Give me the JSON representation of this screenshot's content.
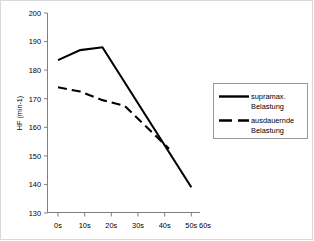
{
  "chart_data": {
    "type": "line",
    "title": "",
    "subtitle": "",
    "xlabel": "",
    "ylabel": "HF (min-1)",
    "categories": [
      "0s",
      "10s",
      "20s",
      "30s",
      "40s",
      "50s",
      "60s"
    ],
    "x": [
      0,
      10,
      20,
      30,
      40,
      50,
      60
    ],
    "xlim": [
      0,
      60
    ],
    "ylim": [
      130,
      200
    ],
    "yticks": [
      130,
      140,
      150,
      160,
      170,
      180,
      190,
      200
    ],
    "ytick_labels": [
      "130",
      "140",
      "150",
      "160",
      "170",
      "180",
      "190",
      "200"
    ],
    "grid": false,
    "legend_position": "right",
    "series": [
      {
        "name": "supramax. Belastung",
        "style": "solid",
        "color": "#000000",
        "x": [
          0,
          10,
          20,
          60
        ],
        "values": [
          183.5,
          187,
          188,
          139
        ],
        "x_labels": [
          "0s",
          "10s",
          "20s",
          "60s"
        ]
      },
      {
        "name": "ausdauernde Belastung",
        "style": "dashed",
        "color": "#000000",
        "x": [
          0,
          10,
          20,
          30,
          50
        ],
        "values": [
          174,
          172.5,
          169.5,
          167.5,
          152.5
        ],
        "x_labels": [
          "0s",
          "10s",
          "20s",
          "30s",
          "50s"
        ]
      }
    ]
  },
  "legend": {
    "entries": [
      {
        "label_line1": "supramax.",
        "label_line2": "Belastung",
        "style": "solid"
      },
      {
        "label_line1": "ausdauernde",
        "label_line2": "Belastung",
        "style": "dashed"
      }
    ]
  },
  "axes": {
    "y_title": "HF (min-1)",
    "y_tick_labels": [
      "200",
      "190",
      "180",
      "170",
      "160",
      "150",
      "140",
      "130"
    ],
    "x_tick_labels": [
      "0s",
      "10s",
      "20s",
      "30s",
      "40s",
      "50s",
      "60s"
    ]
  },
  "colors": {
    "line": "#000000",
    "axis": "#808080",
    "frame": "#d9d9d9",
    "legend_border": "#9a9a9a"
  }
}
